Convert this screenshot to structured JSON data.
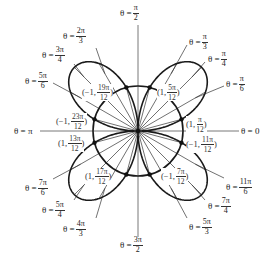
{
  "diagram": {
    "center": {
      "x": 138,
      "y": 131
    },
    "unit_px": 45,
    "curves": [
      {
        "name": "unit-circle",
        "equation": "r = 1"
      },
      {
        "name": "four-petal-rose",
        "equation": "r = 2 sin(2θ)"
      }
    ],
    "colors": {
      "curve": "#1a1a1a",
      "axis": "#555555",
      "ray": "#333333",
      "text": "#333333"
    },
    "axis_labels": [
      {
        "id": "theta-pi-over-2",
        "prefix": "θ = ",
        "num": "π",
        "den": "2",
        "x": 120,
        "y": 4
      },
      {
        "id": "theta-pi",
        "prefix": "θ = π",
        "num": "",
        "den": "",
        "x": 14,
        "y": 127
      },
      {
        "id": "theta-0",
        "prefix": "θ = 0",
        "num": "",
        "den": "",
        "x": 241,
        "y": 127
      },
      {
        "id": "theta-3pi-over-2",
        "prefix": "θ = ",
        "num": "3π",
        "den": "2",
        "x": 120,
        "y": 236
      }
    ],
    "ray_labels": [
      {
        "id": "theta-2pi-over-3",
        "prefix": "θ = ",
        "num": "2π",
        "den": "3",
        "x": 63,
        "y": 27
      },
      {
        "id": "theta-3pi-over-4",
        "prefix": "θ = ",
        "num": "3π",
        "den": "4",
        "x": 42,
        "y": 46
      },
      {
        "id": "theta-5pi-over-6",
        "prefix": "θ = ",
        "num": "5π",
        "den": "6",
        "x": 25,
        "y": 72
      },
      {
        "id": "theta-pi-over-3",
        "prefix": "θ = ",
        "num": "π",
        "den": "3",
        "x": 189,
        "y": 33
      },
      {
        "id": "theta-pi-over-4",
        "prefix": "θ = ",
        "num": "π",
        "den": "4",
        "x": 208,
        "y": 50
      },
      {
        "id": "theta-pi-over-6",
        "prefix": "θ = ",
        "num": "π",
        "den": "6",
        "x": 226,
        "y": 75
      },
      {
        "id": "theta-7pi-over-6",
        "prefix": "θ = ",
        "num": "7π",
        "den": "6",
        "x": 25,
        "y": 179
      },
      {
        "id": "theta-5pi-over-4",
        "prefix": "θ = ",
        "num": "5π",
        "den": "4",
        "x": 42,
        "y": 201
      },
      {
        "id": "theta-4pi-over-3",
        "prefix": "θ = ",
        "num": "4π",
        "den": "3",
        "x": 63,
        "y": 220
      },
      {
        "id": "theta-11pi-over-6",
        "prefix": "θ = ",
        "num": "11π",
        "den": "6",
        "x": 226,
        "y": 178
      },
      {
        "id": "theta-7pi-over-4",
        "prefix": "θ = ",
        "num": "7π",
        "den": "4",
        "x": 208,
        "y": 197
      },
      {
        "id": "theta-5pi-over-3",
        "prefix": "θ = ",
        "num": "5π",
        "den": "3",
        "x": 189,
        "y": 218
      }
    ],
    "ray_angles_deg": [
      15,
      30,
      45,
      60,
      75,
      105,
      120,
      135,
      150,
      165,
      195,
      210,
      225,
      240,
      255,
      285,
      300,
      315,
      330,
      345
    ],
    "label_leaders": [
      {
        "from": [
          96,
          48
        ],
        "to_angle_deg": 120
      },
      {
        "from": [
          74,
          64
        ],
        "to_angle_deg": 135
      },
      {
        "from": [
          53,
          83
        ],
        "to_angle_deg": 150
      },
      {
        "from": [
          187,
          45
        ],
        "to_angle_deg": 60
      },
      {
        "from": [
          205,
          62
        ],
        "to_angle_deg": 45
      },
      {
        "from": [
          224,
          86
        ],
        "to_angle_deg": 30
      },
      {
        "from": [
          53,
          179
        ],
        "to_angle_deg": 210
      },
      {
        "from": [
          74,
          200
        ],
        "to_angle_deg": 225
      },
      {
        "from": [
          96,
          218
        ],
        "to_angle_deg": 240
      },
      {
        "from": [
          224,
          178
        ],
        "to_angle_deg": 330
      },
      {
        "from": [
          205,
          200
        ],
        "to_angle_deg": 315
      },
      {
        "from": [
          187,
          218
        ],
        "to_angle_deg": 300
      }
    ],
    "intersection_points": [
      {
        "id": "pt-neg1-19pi-12",
        "prefix": "(−1, ",
        "num": "19π",
        "den": "12",
        "suffix": ")",
        "x": 82,
        "y": 84,
        "dot_angle_deg": 105
      },
      {
        "id": "pt-1-5pi-12",
        "prefix": "(1, ",
        "num": "5π",
        "den": "12",
        "suffix": ")",
        "x": 157,
        "y": 84,
        "dot_angle_deg": 75
      },
      {
        "id": "pt-neg1-23pi-12",
        "prefix": "(−1, ",
        "num": "23π",
        "den": "12",
        "suffix": ")",
        "x": 56,
        "y": 113,
        "dot_angle_deg": 165
      },
      {
        "id": "pt-1-13pi-12",
        "prefix": "(1, ",
        "num": "13π",
        "den": "12",
        "suffix": ")",
        "x": 58,
        "y": 135,
        "dot_angle_deg": 195
      },
      {
        "id": "pt-1-pi-12",
        "prefix": "(1, ",
        "num": "π",
        "den": "12",
        "suffix": ")",
        "x": 186,
        "y": 116,
        "dot_angle_deg": 15
      },
      {
        "id": "pt-neg1-11pi-12",
        "prefix": "(−1, ",
        "num": "11π",
        "den": "12",
        "suffix": ")",
        "x": 186,
        "y": 136,
        "dot_angle_deg": 345
      },
      {
        "id": "pt-1-17pi-12",
        "prefix": "(1, ",
        "num": "17π",
        "den": "12",
        "suffix": ")",
        "x": 85,
        "y": 168,
        "dot_angle_deg": 255
      },
      {
        "id": "pt-neg1-7pi-12",
        "prefix": "(−1, ",
        "num": "7π",
        "den": "12",
        "suffix": ")",
        "x": 161,
        "y": 168,
        "dot_angle_deg": 285
      }
    ]
  }
}
